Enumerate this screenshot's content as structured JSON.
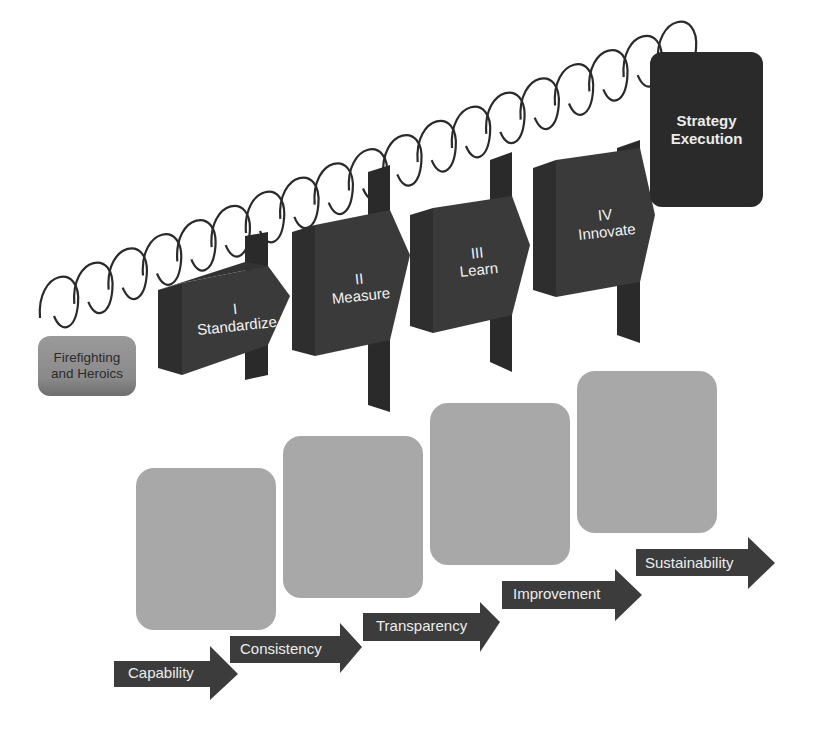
{
  "diagram": {
    "start_box": {
      "line1": "Firefighting",
      "line2": "and Heroics"
    },
    "stages": [
      {
        "numeral": "I",
        "label": "Standardize"
      },
      {
        "numeral": "II",
        "label": "Measure"
      },
      {
        "numeral": "III",
        "label": "Learn"
      },
      {
        "numeral": "IV",
        "label": "Innovate"
      }
    ],
    "goal_box": {
      "line1": "Strategy",
      "line2": "Execution"
    },
    "outcomes": [
      {
        "label": "Capability"
      },
      {
        "label": "Consistency"
      },
      {
        "label": "Transparency"
      },
      {
        "label": "Improvement"
      },
      {
        "label": "Sustainability"
      }
    ],
    "colors": {
      "stage_fill": "#3a3a3a",
      "stage_side": "#2e2e2e",
      "goal_fill": "#2a2a2a",
      "square_fill": "#a8a8a8",
      "arrow_fill": "#3c3c3c",
      "start_fill": "#8f8f8f",
      "spring_stroke": "#2a2a2a"
    }
  }
}
